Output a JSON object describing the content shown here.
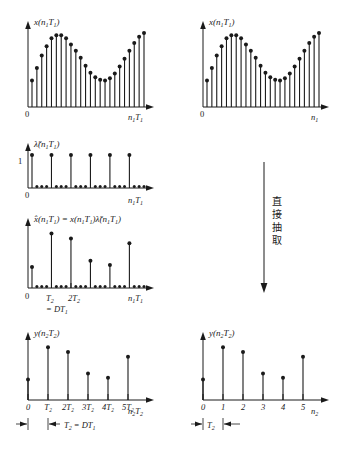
{
  "figure": {
    "title_text": "",
    "arrow_label_cjk": "直接抽取",
    "colors": {
      "ink": "#1a1a1a",
      "background": "#ffffff"
    }
  },
  "panels": {
    "top_left": {
      "name": "x(n1T1) continuous-time-index sequence",
      "ylabel": "x(n₁T₁)",
      "xlabel": "n₁T₁",
      "origin_tick": "0"
    },
    "top_right": {
      "name": "x(n1T1) sample-index sequence",
      "ylabel": "x(n₁T₁)",
      "xlabel": "n₁",
      "origin_tick": "0"
    },
    "mid_sampler": {
      "name": "sampling comb lambda tilde",
      "ylabel": "λ̃(n₁T₁)",
      "xlabel": "n₁T₁",
      "origin_tick": "0",
      "ytick": "1"
    },
    "mid_product": {
      "name": "x hat product sequence",
      "ylabel": "x̂(n₁T₁) = x(n₁T₁)λ̃(n₁T₁)",
      "xlabel": "n₁T₁",
      "origin_tick": "0",
      "xticks": [
        "T₂",
        "2T₂"
      ],
      "note": "= DT₁"
    },
    "bottom_left": {
      "name": "y(n2T2) decimated with time axis",
      "ylabel": "y(n₂T₂)",
      "xlabel": "n₂T₂",
      "xticks": [
        "0",
        "T₂",
        "2T₂",
        "3T₂",
        "4T₂",
        "5T₂"
      ],
      "dim_label": "T₂ = DT₁"
    },
    "bottom_right": {
      "name": "y(n2T2) decimated with sample index",
      "ylabel": "y(n₂T₂)",
      "xlabel": "n₂",
      "xticks": [
        "0",
        "1",
        "2",
        "3",
        "4",
        "5"
      ],
      "dim_label": "T₂"
    }
  },
  "chart_data": [
    {
      "id": "top_left",
      "type": "stem",
      "title": "",
      "ylabel": "x(n₁T₁)",
      "xlabel": "n₁T₁",
      "x": [
        0,
        1,
        2,
        3,
        4,
        5,
        6,
        7,
        8,
        9,
        10,
        11,
        12,
        13,
        14,
        15,
        16,
        17,
        18,
        19,
        20,
        21,
        22,
        23
      ],
      "values": [
        0.34,
        0.5,
        0.66,
        0.78,
        0.88,
        0.92,
        0.92,
        0.88,
        0.8,
        0.72,
        0.63,
        0.53,
        0.44,
        0.38,
        0.35,
        0.34,
        0.37,
        0.43,
        0.52,
        0.62,
        0.72,
        0.82,
        0.9,
        0.95
      ],
      "ylim": [
        0,
        1.0
      ],
      "grid": false,
      "markers": "filled-circle"
    },
    {
      "id": "top_right",
      "type": "stem",
      "title": "",
      "ylabel": "x(n₁T₁)",
      "xlabel": "n₁",
      "x": [
        0,
        1,
        2,
        3,
        4,
        5,
        6,
        7,
        8,
        9,
        10,
        11,
        12,
        13,
        14,
        15,
        16,
        17,
        18,
        19,
        20,
        21,
        22,
        23
      ],
      "values": [
        0.34,
        0.5,
        0.66,
        0.78,
        0.88,
        0.92,
        0.92,
        0.88,
        0.8,
        0.72,
        0.63,
        0.53,
        0.44,
        0.38,
        0.35,
        0.34,
        0.37,
        0.43,
        0.52,
        0.62,
        0.72,
        0.82,
        0.9,
        0.95
      ],
      "ylim": [
        0,
        1.0
      ],
      "grid": false,
      "markers": "filled-circle"
    },
    {
      "id": "mid_sampler",
      "type": "stem",
      "title": "",
      "ylabel": "λ̃(n₁T₁)",
      "xlabel": "n₁T₁",
      "x": [
        0,
        1,
        2,
        3,
        4,
        5,
        6,
        7,
        8,
        9,
        10,
        11,
        12,
        13,
        14,
        15,
        16,
        17,
        18,
        19,
        20,
        21,
        22,
        23
      ],
      "values": [
        1,
        0,
        0,
        0,
        1,
        0,
        0,
        0,
        1,
        0,
        0,
        0,
        1,
        0,
        0,
        0,
        1,
        0,
        0,
        0,
        1,
        0,
        0,
        0
      ],
      "ylim": [
        0,
        1.0
      ],
      "yticks": [
        1
      ],
      "ytick_labels": [
        "1"
      ],
      "decimation_factor": 4,
      "grid": false,
      "markers": "filled-circle"
    },
    {
      "id": "mid_product",
      "type": "stem",
      "title": "",
      "ylabel": "x̂(n₁T₁) = x(n₁T₁)λ̃(n₁T₁)",
      "xlabel": "n₁T₁",
      "x": [
        0,
        1,
        2,
        3,
        4,
        5,
        6,
        7,
        8,
        9,
        10,
        11,
        12,
        13,
        14,
        15,
        16,
        17,
        18,
        19,
        20,
        21,
        22,
        23
      ],
      "values": [
        0.34,
        0,
        0,
        0,
        0.88,
        0,
        0,
        0,
        0.8,
        0,
        0,
        0,
        0.44,
        0,
        0,
        0,
        0.37,
        0,
        0,
        0,
        0.72,
        0,
        0,
        0
      ],
      "ylim": [
        0,
        1.0
      ],
      "xtick_positions": [
        4,
        8
      ],
      "xtick_labels": [
        "T₂",
        "2T₂"
      ],
      "annotation": "= DT₁",
      "grid": false,
      "markers": "filled-circle"
    },
    {
      "id": "bottom_left",
      "type": "stem",
      "title": "",
      "ylabel": "y(n₂T₂)",
      "xlabel": "n₂T₂",
      "x": [
        0,
        1,
        2,
        3,
        4,
        5
      ],
      "values": [
        0.34,
        0.88,
        0.8,
        0.44,
        0.37,
        0.72
      ],
      "ylim": [
        0,
        1.0
      ],
      "xtick_labels": [
        "0",
        "T₂",
        "2T₂",
        "3T₂",
        "4T₂",
        "5T₂"
      ],
      "annotation": "T₂ = DT₁",
      "grid": false,
      "markers": "filled-circle"
    },
    {
      "id": "bottom_right",
      "type": "stem",
      "title": "",
      "ylabel": "y(n₂T₂)",
      "xlabel": "n₂",
      "x": [
        0,
        1,
        2,
        3,
        4,
        5
      ],
      "values": [
        0.34,
        0.88,
        0.8,
        0.44,
        0.37,
        0.72
      ],
      "ylim": [
        0,
        1.0
      ],
      "xtick_labels": [
        "0",
        "1",
        "2",
        "3",
        "4",
        "5"
      ],
      "annotation": "T₂",
      "grid": false,
      "markers": "filled-circle"
    }
  ]
}
